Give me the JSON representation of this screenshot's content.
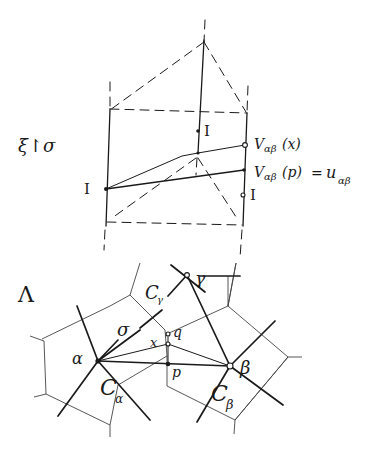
{
  "diagram": {
    "upper_block": {
      "map_label": "ξ↾σ",
      "identity_labels": [
        "I",
        "I",
        "I"
      ],
      "label_v_x": "V",
      "label_v_x_sub": "αβ",
      "label_v_x_arg": "(x)",
      "label_v_p": "V",
      "label_v_p_sub": "αβ",
      "label_v_p_arg": "(p)",
      "label_eq": "=",
      "label_u": "u",
      "label_u_sub": "αβ"
    },
    "lower_block": {
      "lattice_label": "Λ",
      "nodes": {
        "alpha": "α",
        "beta": "β",
        "gamma": "γ",
        "x": "x",
        "p": "p",
        "q": "q"
      },
      "cells": {
        "c_alpha": "C",
        "c_alpha_sub": "α",
        "c_beta": "C",
        "c_beta_sub": "β",
        "c_gamma": "C",
        "c_gamma_sub": "γ"
      },
      "simplex_label": "σ"
    },
    "colors": {
      "ink": "#1a1a1a",
      "background": "#ffffff"
    }
  }
}
